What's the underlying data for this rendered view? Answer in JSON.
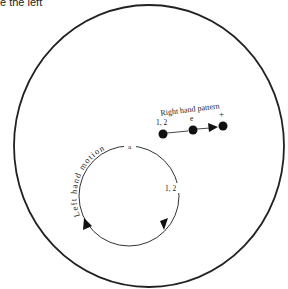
{
  "caption": "e the left",
  "diagram": {
    "outer_circle": {
      "cx": 149,
      "cy": 146,
      "rx": 135,
      "ry": 141
    },
    "inner_circle": {
      "cx": 129,
      "cy": 196,
      "r": 50
    },
    "left_hand": {
      "title": "Left hand motion",
      "top_label": "a",
      "side_label": "1, 2"
    },
    "right_hand": {
      "title": "Right hand pattern",
      "beats": [
        {
          "label": "1, 2",
          "x": 163,
          "y": 134
        },
        {
          "label": "e",
          "x": 193,
          "y": 130
        },
        {
          "label": "+",
          "x": 223,
          "y": 126
        }
      ]
    },
    "colors": {
      "stroke": "#222222",
      "background": "#ffffff"
    }
  }
}
